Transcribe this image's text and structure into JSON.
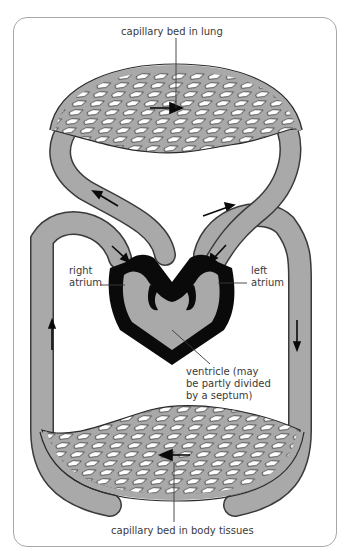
{
  "diagram": {
    "labels": {
      "lung_capillary": "capillary bed in lung",
      "right_atrium_1": "right",
      "right_atrium_2": "atrium",
      "left_atrium_1": "left",
      "left_atrium_2": "atrium",
      "ventricle_1": "ventricle (may",
      "ventricle_2": "be partly divided",
      "ventricle_3": "by a septum)",
      "body_capillary": "capillary bed in body tissues"
    },
    "colors": {
      "vessel_fill": "#a9a9a9",
      "vessel_outline": "#3a3a3a",
      "heart_wall": "#0a0a0a",
      "label_text": "#3a3a3a",
      "leader_line": "#7a7a7a",
      "frame": "#a8a8a8"
    }
  }
}
